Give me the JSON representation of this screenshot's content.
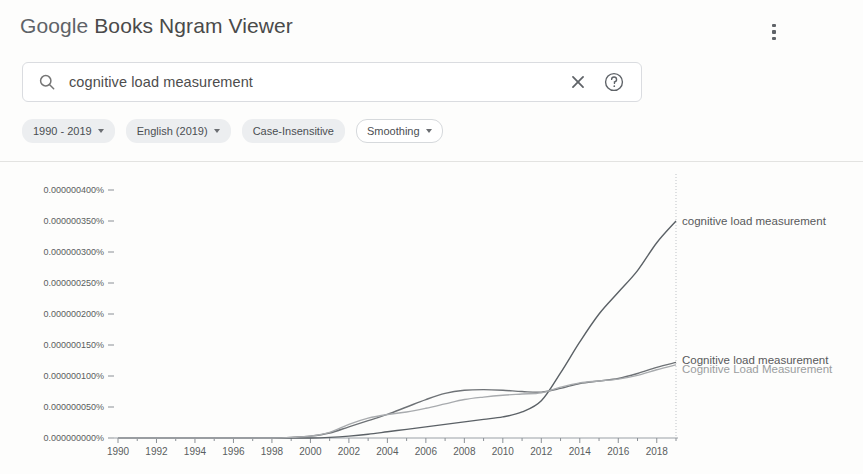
{
  "header": {
    "title_google": "Google",
    "title_rest": " Books Ngram Viewer",
    "overflow_menu_name": "more-options"
  },
  "search": {
    "value": "cognitive load measurement",
    "placeholder": "Search in Google Books Ngram Viewer",
    "search_icon": "search-icon",
    "clear_icon": "close-icon",
    "help_icon": "help-circle-icon"
  },
  "chips": [
    {
      "label": "1990 - 2019",
      "caret": true,
      "style": "filled"
    },
    {
      "label": "English (2019)",
      "caret": true,
      "style": "filled"
    },
    {
      "label": "Case-Insensitive",
      "caret": false,
      "style": "filled"
    },
    {
      "label": "Smoothing",
      "caret": true,
      "style": "outlined"
    }
  ],
  "colors": {
    "series_1": "#5b6166",
    "series_2": "#6e7276",
    "series_3": "#a8abae",
    "axis": "#9aa0a6",
    "text": "#5a5d60",
    "chip_bg": "#eceef0",
    "divider": "#e3e3e1"
  },
  "chart_data": {
    "type": "line",
    "title": "",
    "xlabel": "",
    "ylabel": "",
    "xlim": [
      1990,
      2019
    ],
    "ylim": [
      0.0,
      4e-07
    ],
    "grid": false,
    "legend_position": "right-of-plot",
    "x_tick_labels": [
      "1990",
      "1992",
      "1994",
      "1996",
      "1998",
      "2000",
      "2002",
      "2004",
      "2006",
      "2008",
      "2010",
      "2012",
      "2014",
      "2016",
      "2018"
    ],
    "x_ticks": [
      1990,
      1992,
      1994,
      1996,
      1998,
      2000,
      2002,
      2004,
      2006,
      2008,
      2010,
      2012,
      2014,
      2016,
      2018
    ],
    "y_tick_labels": [
      "0.000000400%",
      "0.000000350%",
      "0.000000300%",
      "0.000000250%",
      "0.000000200%",
      "0.000000150%",
      "0.000000100%",
      "0.000000050%",
      "0.000000000%"
    ],
    "y_ticks": [
      4e-07,
      3.5e-07,
      3e-07,
      2.5e-07,
      2e-07,
      1.5e-07,
      1e-07,
      5e-08,
      0.0
    ],
    "x": [
      1990,
      1991,
      1992,
      1993,
      1994,
      1995,
      1996,
      1997,
      1998,
      1999,
      2000,
      2001,
      2002,
      2003,
      2004,
      2005,
      2006,
      2007,
      2008,
      2009,
      2010,
      2011,
      2012,
      2013,
      2014,
      2015,
      2016,
      2017,
      2018,
      2019
    ],
    "series": [
      {
        "name": "cognitive load measurement",
        "color": "#5b6166",
        "label_color": "#58595b",
        "values": [
          0.0,
          0.0,
          0.0,
          0.0,
          0.0,
          0.0,
          0.0,
          0.0,
          0.0,
          0.0,
          0.0,
          1e-09,
          3e-09,
          6e-09,
          1e-08,
          1.4e-08,
          1.8e-08,
          2.2e-08,
          2.6e-08,
          3e-08,
          3.4e-08,
          4.2e-08,
          6e-08,
          1.05e-07,
          1.55e-07,
          2e-07,
          2.35e-07,
          2.7e-07,
          3.15e-07,
          3.5e-07
        ]
      },
      {
        "name": "Cognitive load measurement",
        "color": "#6e7276",
        "label_color": "#58595b",
        "values": [
          0.0,
          0.0,
          0.0,
          0.0,
          0.0,
          0.0,
          0.0,
          0.0,
          0.0,
          1e-09,
          3e-09,
          8e-09,
          1.8e-08,
          2.8e-08,
          3.8e-08,
          5e-08,
          6.2e-08,
          7.2e-08,
          7.7e-08,
          7.8e-08,
          7.7e-08,
          7.5e-08,
          7.4e-08,
          8e-08,
          8.8e-08,
          9.2e-08,
          9.6e-08,
          1.04e-07,
          1.14e-07,
          1.22e-07
        ]
      },
      {
        "name": "Cognitive Load Measurement",
        "color": "#a8abae",
        "label_color": "#9b9d9f",
        "values": [
          0.0,
          0.0,
          0.0,
          0.0,
          0.0,
          0.0,
          0.0,
          0.0,
          0.0,
          1e-09,
          3e-09,
          9e-09,
          2.2e-08,
          3.2e-08,
          3.8e-08,
          4.2e-08,
          4.8e-08,
          5.5e-08,
          6.2e-08,
          6.6e-08,
          6.9e-08,
          7.1e-08,
          7.3e-08,
          8.2e-08,
          8.9e-08,
          9.2e-08,
          9.5e-08,
          1.01e-07,
          1.1e-07,
          1.18e-07
        ]
      }
    ],
    "legend_entries": [
      {
        "label": "cognitive load measurement",
        "anchor_value": 3.5e-07,
        "muted": false
      },
      {
        "label": "Cognitive load measurement",
        "anchor_value": 1.26e-07,
        "muted": false
      },
      {
        "label": "Cognitive Load Measurement",
        "anchor_value": 1.12e-07,
        "muted": true
      }
    ]
  }
}
